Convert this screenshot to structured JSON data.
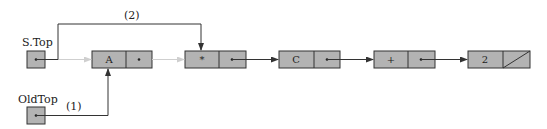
{
  "diagram": {
    "pointers": [
      {
        "name": "S.Top",
        "label": "S.Top"
      },
      {
        "name": "OldTop",
        "label": "OldTop"
      }
    ],
    "nodes": [
      {
        "value": "A",
        "next": "pointer"
      },
      {
        "value": "*",
        "next": "pointer"
      },
      {
        "value": "C",
        "next": "pointer"
      },
      {
        "value": "+",
        "next": "pointer"
      },
      {
        "value": "2",
        "next": "null"
      }
    ],
    "step_labels": {
      "step1": "(1)",
      "step2": "(2)"
    },
    "colors": {
      "node_fill": "#b3b3b3",
      "stroke": "#333333",
      "faded_link": "#cfcfcf"
    }
  }
}
